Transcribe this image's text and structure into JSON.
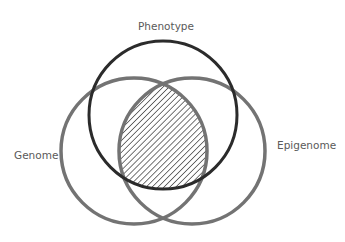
{
  "diagram": {
    "type": "venn",
    "sets": [
      {
        "id": "phenotype",
        "label": "Phenotype",
        "cx": 163,
        "cy": 115,
        "r": 74,
        "stroke": "#2b2b2b",
        "stroke_width": 3
      },
      {
        "id": "genome",
        "label": "Genome",
        "cx": 134,
        "cy": 151,
        "r": 73,
        "stroke": "#737373",
        "stroke_width": 3.5
      },
      {
        "id": "epigenome",
        "label": "Epigenome",
        "cx": 192,
        "cy": 151,
        "r": 73,
        "stroke": "#737373",
        "stroke_width": 3.5
      }
    ],
    "highlight": {
      "region": "Genome ∩ Epigenome ∩ Phenotype",
      "fill": "diagonal-hatch",
      "hatch_color": "#2b2b2b"
    },
    "labels": {
      "phenotype": {
        "text": "Phenotype",
        "x": 166,
        "y": 30
      },
      "genome": {
        "text": "Genome",
        "x": 14,
        "y": 159
      },
      "epigenome": {
        "text": "Epigenome",
        "x": 277,
        "y": 149
      }
    },
    "text_color": "#5a5a5a",
    "background": "#ffffff"
  }
}
